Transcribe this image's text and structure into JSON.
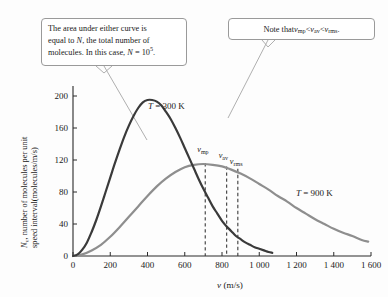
{
  "figure": {
    "background": "#fdfdfd",
    "callouts": [
      {
        "name": "area-note",
        "line1": "The area under either curve is",
        "line2": "equal to ",
        "line2_italic": "N",
        "line2_rest": ", the total number of",
        "line3": "molecules. In this case, ",
        "line3_italic": "N",
        "line3_eq": " = 10",
        "line3_sup": "5",
        "line3_end": "."
      },
      {
        "name": "order-note",
        "prefix": "Note that ",
        "v1": "v",
        "v1_sub": "mp",
        "lt1": " < ",
        "v2": "v",
        "v2_sub": "av",
        "lt2": " < ",
        "v3": "v",
        "v3_sub": "rms",
        "suffix": "."
      }
    ]
  },
  "chart_data": {
    "type": "line",
    "title": "",
    "xlabel": "v (m/s)",
    "xlabel_italic": "v",
    "xlabel_unit": " (m/s)",
    "ylabel": "N_v, number of molecules per unit speed interval(molecules/m/s)",
    "ylabel_italic": "N",
    "ylabel_sub": "v",
    "ylabel_line1": ", number of molecules per unit",
    "ylabel_line2": "speed interval(molecules/m/s)",
    "xlim": [
      0,
      1600
    ],
    "ylim": [
      0,
      210
    ],
    "xticks": [
      0,
      200,
      400,
      600,
      800,
      1000,
      1200,
      1400,
      1600
    ],
    "xticklabels": [
      "0",
      "200",
      "400",
      "600",
      "800",
      "1 000",
      "1 200",
      "1 400",
      "1 600"
    ],
    "yticks": [
      0,
      40,
      80,
      120,
      160,
      200
    ],
    "yticklabels": [
      "0",
      "40",
      "80",
      "120",
      "160",
      "200"
    ],
    "grid": false,
    "legend_position": "inline-labels",
    "series": [
      {
        "name": "T = 300 K",
        "label_italic": "T",
        "label_rest": " = 300 K",
        "color": "#3a3a3a",
        "temperature_K": 300,
        "peak_x": 400,
        "peak_y": 195,
        "x_end": 1070,
        "x": [
          0,
          25,
          50,
          75,
          100,
          125,
          150,
          175,
          200,
          225,
          250,
          275,
          300,
          325,
          350,
          375,
          400,
          425,
          450,
          475,
          500,
          525,
          550,
          575,
          600,
          625,
          650,
          675,
          700,
          725,
          750,
          775,
          800,
          825,
          850,
          875,
          900,
          925,
          950,
          975,
          1000,
          1025,
          1050,
          1070
        ],
        "y": [
          0,
          2,
          8,
          17,
          30,
          45,
          62,
          80,
          98,
          116,
          133,
          149,
          163,
          175,
          185,
          192,
          195,
          195,
          193,
          188,
          180,
          171,
          160,
          148,
          135,
          122,
          109,
          96,
          84,
          73,
          62,
          53,
          44,
          37,
          31,
          25,
          21,
          17,
          14,
          11,
          9,
          7,
          5,
          4
        ]
      },
      {
        "name": "T = 900 K",
        "label_italic": "T",
        "label_rest": " = 900 K",
        "color": "#8e8e8e",
        "temperature_K": 900,
        "peak_x": 700,
        "peak_y": 115,
        "x_end": 1585,
        "x": [
          0,
          50,
          100,
          150,
          200,
          250,
          300,
          350,
          400,
          450,
          500,
          550,
          600,
          650,
          700,
          750,
          800,
          850,
          900,
          950,
          1000,
          1050,
          1100,
          1150,
          1200,
          1250,
          1300,
          1350,
          1400,
          1450,
          1500,
          1550,
          1585
        ],
        "y": [
          0,
          2,
          7,
          14,
          24,
          36,
          49,
          62,
          75,
          87,
          97,
          105,
          111,
          114,
          115,
          114,
          112,
          108,
          103,
          97,
          90,
          83,
          75,
          68,
          60,
          53,
          46,
          40,
          34,
          29,
          25,
          20,
          18
        ]
      }
    ],
    "vlines": [
      {
        "name": "v_mp",
        "label": "v",
        "sub": "mp",
        "x": 710,
        "y_top": 116,
        "y_bottom": 0
      },
      {
        "name": "v_av",
        "label": "v",
        "sub": "av",
        "x": 825,
        "y_top": 112,
        "y_bottom": 0
      },
      {
        "name": "v_rms",
        "label": "v",
        "sub": "rms",
        "x": 885,
        "y_top": 109,
        "y_bottom": 0
      }
    ],
    "annotations": [
      {
        "name": "leader-area-note",
        "from": [
          104,
          66
        ],
        "to": [
          147,
          140
        ]
      },
      {
        "name": "leader-order-note",
        "from": [
          268,
          40
        ],
        "to": [
          228,
          118
        ]
      }
    ]
  }
}
